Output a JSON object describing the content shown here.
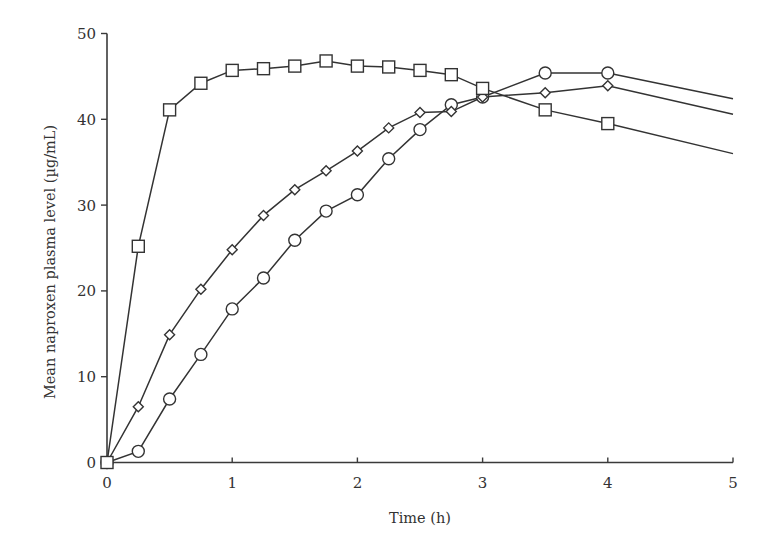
{
  "chart_data": {
    "type": "line",
    "title": "",
    "xlabel": "Time (h)",
    "ylabel": "Mean naproxen plasma level (µg/mL)",
    "xlim": [
      0,
      5
    ],
    "ylim": [
      0,
      50
    ],
    "xticks": [
      0,
      1,
      2,
      3,
      4,
      5
    ],
    "yticks": [
      0,
      10,
      20,
      30,
      40,
      50
    ],
    "xtick_labels": [
      "0",
      "1",
      "2",
      "3",
      "4",
      "5"
    ],
    "ytick_labels": [
      "0",
      "10",
      "20",
      "30",
      "40",
      "50"
    ],
    "grid": false,
    "legend": "none",
    "colors": {
      "line": "#333333",
      "axis": "#3a3a3a",
      "marker_fill": "#ffffff"
    },
    "series": [
      {
        "name": "square",
        "marker": "square",
        "x": [
          0,
          0.25,
          0.5,
          0.75,
          1,
          1.25,
          1.5,
          1.75,
          2,
          2.25,
          2.5,
          2.75,
          3,
          3.5,
          4,
          5
        ],
        "values": [
          0,
          25.2,
          41.1,
          44.2,
          45.7,
          45.9,
          46.2,
          46.8,
          46.2,
          46.1,
          45.7,
          45.2,
          43.6,
          41.1,
          39.5,
          36.0
        ],
        "marker_upto": 4
      },
      {
        "name": "diamond",
        "marker": "diamond",
        "x": [
          0,
          0.25,
          0.5,
          0.75,
          1,
          1.25,
          1.5,
          1.75,
          2,
          2.25,
          2.5,
          2.75,
          3,
          3.5,
          4,
          5
        ],
        "values": [
          0,
          6.5,
          14.9,
          20.2,
          24.8,
          28.8,
          31.8,
          34.0,
          36.3,
          39.0,
          40.8,
          40.9,
          42.6,
          43.1,
          43.9,
          40.6
        ],
        "marker_upto": 4
      },
      {
        "name": "circle",
        "marker": "circle",
        "x": [
          0,
          0.25,
          0.5,
          0.75,
          1,
          1.25,
          1.5,
          1.75,
          2,
          2.25,
          2.5,
          2.75,
          3,
          3.5,
          4,
          5
        ],
        "values": [
          0,
          1.3,
          7.4,
          12.6,
          17.9,
          21.5,
          25.9,
          29.3,
          31.2,
          35.4,
          38.8,
          41.7,
          42.6,
          45.4,
          45.4,
          42.4
        ],
        "marker_upto": 4
      }
    ]
  }
}
